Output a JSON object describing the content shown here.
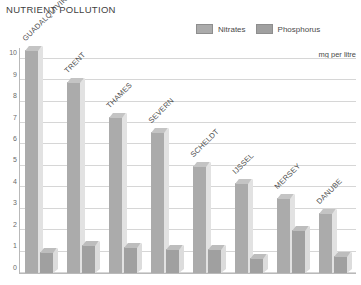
{
  "title": "NUTRIENT POLLUTION",
  "unit_caption": "mg per litre",
  "legend": {
    "position": "top-right",
    "entries": [
      {
        "label": "Nitrates",
        "color": "#ababab"
      },
      {
        "label": "Phosphorus",
        "color": "#a0a0a0"
      }
    ]
  },
  "chart_data": {
    "type": "bar",
    "title": "NUTRIENT POLLUTION",
    "subtitle": "",
    "xlabel": "",
    "ylabel": "mg per litre",
    "ylim": [
      0,
      10.5
    ],
    "yticks": [
      0,
      1,
      2,
      3,
      4,
      5,
      6,
      7,
      8,
      9,
      10
    ],
    "ytick_labels": [
      "0",
      "1",
      "2",
      "3",
      "4",
      "5",
      "6",
      "7",
      "8",
      "9",
      "10"
    ],
    "grid": true,
    "legend_position": "top-right",
    "categories": [
      "GUADALQUIVIR",
      "TRENT",
      "THAMES",
      "SEVERN",
      "SCHELDT",
      "IJSSEL",
      "MERSEY",
      "DANUBE"
    ],
    "series": [
      {
        "name": "Nitrates",
        "color": "#ababab",
        "values": [
          10.4,
          8.9,
          7.3,
          6.6,
          5.0,
          4.2,
          3.5,
          2.8
        ]
      },
      {
        "name": "Phosphorus",
        "color": "#a0a0a0",
        "values": [
          1.0,
          1.3,
          1.2,
          1.1,
          1.1,
          0.7,
          2.0,
          0.8
        ]
      }
    ]
  }
}
